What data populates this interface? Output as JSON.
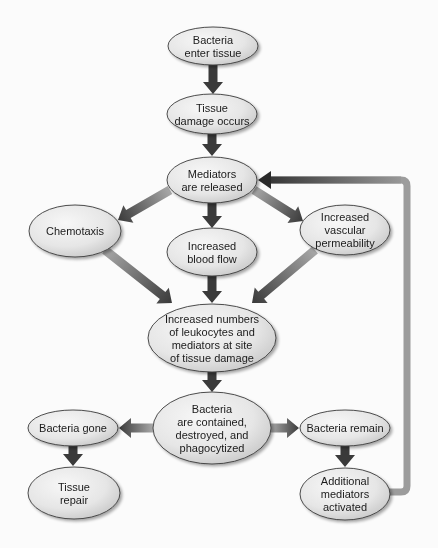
{
  "diagram": {
    "type": "flowchart",
    "title": "",
    "colors": {
      "background": "#fbfbfb",
      "node_fill_light": "#f4f4f4",
      "node_fill_dark": "#c9c9c9",
      "node_stroke": "#3a3a3a",
      "arrow_dark": "#3a3a3a",
      "arrow_light": "#a8a8a8",
      "feedback_line": "#9c9c9c"
    },
    "nodes": [
      {
        "id": "n1",
        "name": "node-bacteria-enter-tissue",
        "cx": 213,
        "cy": 46,
        "rx": 45,
        "ry": 19,
        "lines": [
          "Bacteria",
          "enter tissue"
        ]
      },
      {
        "id": "n2",
        "name": "node-tissue-damage-occurs",
        "cx": 212,
        "cy": 114,
        "rx": 45,
        "ry": 20,
        "lines": [
          "Tissue",
          "damage occurs"
        ]
      },
      {
        "id": "n3",
        "name": "node-mediators-released",
        "cx": 212,
        "cy": 180,
        "rx": 45,
        "ry": 23,
        "lines": [
          "Mediators",
          "are released"
        ]
      },
      {
        "id": "n4",
        "name": "node-chemotaxis",
        "cx": 75,
        "cy": 231,
        "rx": 46,
        "ry": 26,
        "lines": [
          "Chemotaxis"
        ]
      },
      {
        "id": "n5",
        "name": "node-increased-blood-flow",
        "cx": 212,
        "cy": 252,
        "rx": 45,
        "ry": 24,
        "lines": [
          "Increased",
          "blood flow"
        ]
      },
      {
        "id": "n6",
        "name": "node-increased-vascular-permeability",
        "cx": 345,
        "cy": 230,
        "rx": 45,
        "ry": 25,
        "lines": [
          "Increased",
          "vascular",
          "permeability"
        ]
      },
      {
        "id": "n7",
        "name": "node-increased-leukocytes-mediators",
        "cx": 212,
        "cy": 338,
        "rx": 64,
        "ry": 34,
        "lines": [
          "Increased numbers",
          "of leukocytes and",
          "mediators at site",
          "of tissue damage"
        ]
      },
      {
        "id": "n8",
        "name": "node-bacteria-contained",
        "cx": 212,
        "cy": 428,
        "rx": 59,
        "ry": 36,
        "lines": [
          "Bacteria",
          "are contained,",
          "destroyed, and",
          "phagocytized"
        ]
      },
      {
        "id": "n9",
        "name": "node-bacteria-gone",
        "cx": 73,
        "cy": 428,
        "rx": 45,
        "ry": 18,
        "lines": [
          "Bacteria gone"
        ]
      },
      {
        "id": "n10",
        "name": "node-tissue-repair",
        "cx": 74,
        "cy": 493,
        "rx": 46,
        "ry": 26,
        "lines": [
          "Tissue",
          "repair"
        ]
      },
      {
        "id": "n11",
        "name": "node-bacteria-remain",
        "cx": 345,
        "cy": 428,
        "rx": 45,
        "ry": 18,
        "lines": [
          "Bacteria remain"
        ]
      },
      {
        "id": "n12",
        "name": "node-additional-mediators-activated",
        "cx": 345,
        "cy": 494,
        "rx": 45,
        "ry": 26,
        "lines": [
          "Additional",
          "mediators",
          "activated"
        ]
      }
    ],
    "edges": [
      {
        "name": "arrow-enter-to-damage",
        "from": "n1",
        "to": "n2",
        "x1": 213,
        "y1": 65,
        "x2": 213,
        "y2": 94,
        "style": "dark"
      },
      {
        "name": "arrow-damage-to-mediators",
        "from": "n2",
        "to": "n3",
        "x1": 212,
        "y1": 134,
        "x2": 212,
        "y2": 156,
        "style": "dark"
      },
      {
        "name": "arrow-mediators-to-chemotaxis",
        "from": "n3",
        "to": "n4",
        "x1": 170,
        "y1": 190,
        "x2": 118,
        "y2": 220,
        "style": "gradient"
      },
      {
        "name": "arrow-mediators-to-bloodflow",
        "from": "n3",
        "to": "n5",
        "x1": 212,
        "y1": 203,
        "x2": 212,
        "y2": 228,
        "style": "dark"
      },
      {
        "name": "arrow-mediators-to-vascular",
        "from": "n3",
        "to": "n6",
        "x1": 254,
        "y1": 190,
        "x2": 303,
        "y2": 221,
        "style": "gradient"
      },
      {
        "name": "arrow-chemotaxis-to-leukocytes",
        "from": "n4",
        "to": "n7",
        "x1": 105,
        "y1": 250,
        "x2": 172,
        "y2": 303,
        "style": "gradient"
      },
      {
        "name": "arrow-bloodflow-to-leukocytes",
        "from": "n5",
        "to": "n7",
        "x1": 212,
        "y1": 276,
        "x2": 212,
        "y2": 303,
        "style": "dark"
      },
      {
        "name": "arrow-vascular-to-leukocytes",
        "from": "n6",
        "to": "n7",
        "x1": 315,
        "y1": 250,
        "x2": 252,
        "y2": 303,
        "style": "gradient"
      },
      {
        "name": "arrow-leukocytes-to-contained",
        "from": "n7",
        "to": "n8",
        "x1": 212,
        "y1": 372,
        "x2": 212,
        "y2": 392,
        "style": "dark"
      },
      {
        "name": "arrow-contained-to-gone",
        "from": "n8",
        "to": "n9",
        "x1": 153,
        "y1": 428,
        "x2": 119,
        "y2": 428,
        "style": "gradient"
      },
      {
        "name": "arrow-contained-to-remain",
        "from": "n8",
        "to": "n11",
        "x1": 271,
        "y1": 428,
        "x2": 299,
        "y2": 428,
        "style": "gradient"
      },
      {
        "name": "arrow-gone-to-repair",
        "from": "n9",
        "to": "n10",
        "x1": 73,
        "y1": 446,
        "x2": 73,
        "y2": 466,
        "style": "dark"
      },
      {
        "name": "arrow-remain-to-additional",
        "from": "n11",
        "to": "n12",
        "x1": 345,
        "y1": 446,
        "x2": 345,
        "y2": 467,
        "style": "dark"
      }
    ],
    "feedback": {
      "name": "feedback-loop-additional-to-mediators",
      "from": "n12",
      "to": "n3",
      "points": [
        [
          389,
          492
        ],
        [
          407,
          492
        ],
        [
          407,
          180
        ],
        [
          258,
          180
        ]
      ]
    }
  }
}
